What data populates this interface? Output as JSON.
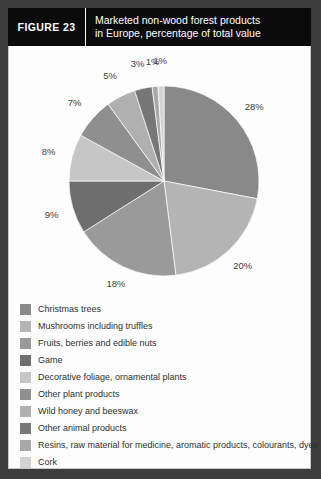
{
  "figure": {
    "number_label": "FIGURE 23",
    "title_line1": "Marketed non-wood forest products",
    "title_line2": "in Europe, percentage of total value"
  },
  "chart_data": {
    "type": "pie",
    "title": "Marketed non-wood forest products in Europe, percentage of total value",
    "unit": "%",
    "legend_position": "bottom",
    "start_angle_deg": 0,
    "direction": "clockwise",
    "categories": [
      "Christmas trees",
      "Mushrooms including truffles",
      "Fruits, berries and edible nuts",
      "Game",
      "Decorative foliage, ornamental plants",
      "Other plant products",
      "Wild honey and beeswax",
      "Other animal products",
      "Resins, raw material for medicine, aromatic products, colourants, dyes",
      "Cork"
    ],
    "values": [
      28,
      20,
      18,
      9,
      8,
      7,
      5,
      3,
      1,
      1
    ],
    "value_labels": [
      "28%",
      "20%",
      "18%",
      "9%",
      "8%",
      "7%",
      "5%",
      "3%",
      "1%",
      "1%"
    ],
    "colors": [
      "#898989",
      "#b4b4b4",
      "#9a9a9a",
      "#6e6e6e",
      "#c6c6c6",
      "#8f8f8f",
      "#b0b0b0",
      "#777777",
      "#a8a8a8",
      "#d2d2d2"
    ]
  },
  "legend": {
    "items": [
      {
        "label": "Christmas trees",
        "color": "#898989"
      },
      {
        "label": "Mushrooms including truffles",
        "color": "#b4b4b4"
      },
      {
        "label": "Fruits, berries and edible nuts",
        "color": "#9a9a9a"
      },
      {
        "label": "Game",
        "color": "#6e6e6e"
      },
      {
        "label": "Decorative foliage, ornamental plants",
        "color": "#c6c6c6"
      },
      {
        "label": "Other plant products",
        "color": "#8f8f8f"
      },
      {
        "label": "Wild honey and beeswax",
        "color": "#b0b0b0"
      },
      {
        "label": "Other animal products",
        "color": "#777777"
      },
      {
        "label": "Resins, raw material for medicine, aromatic products, colourants, dyes",
        "color": "#a8a8a8"
      },
      {
        "label": "Cork",
        "color": "#d2d2d2"
      }
    ]
  }
}
